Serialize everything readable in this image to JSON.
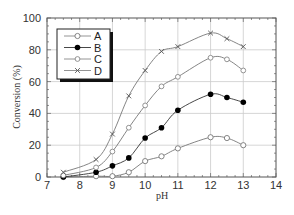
{
  "chart_data": {
    "type": "line",
    "title": "",
    "xlabel": "pH",
    "ylabel": "Conversion (%)",
    "xlim": [
      7,
      14
    ],
    "ylim": [
      0,
      100
    ],
    "xticks": [
      7,
      8,
      9,
      10,
      11,
      12,
      13,
      14
    ],
    "yticks": [
      0,
      20,
      40,
      60,
      80,
      100
    ],
    "grid": true,
    "legend_position": "upper left",
    "x": [
      7.5,
      8.5,
      9,
      9.5,
      10,
      10.5,
      11,
      12,
      12.5,
      13
    ],
    "series": [
      {
        "name": "A",
        "marker": "open-circle",
        "values": [
          0,
          0.5,
          0.5,
          3,
          10,
          13,
          18,
          25,
          24.5,
          20
        ]
      },
      {
        "name": "B",
        "marker": "filled-circle",
        "values": [
          0,
          3,
          7,
          12,
          24.5,
          31,
          42,
          52,
          50,
          47
        ]
      },
      {
        "name": "C",
        "marker": "open-diamond",
        "values": [
          1,
          6,
          16,
          31,
          45,
          57,
          63,
          75,
          74,
          67
        ]
      },
      {
        "name": "D",
        "marker": "cross",
        "values": [
          3,
          11,
          27,
          51,
          67,
          79,
          82,
          90.5,
          87,
          82
        ]
      }
    ]
  },
  "legend": {
    "items": [
      {
        "label": "A"
      },
      {
        "label": "B"
      },
      {
        "label": "C"
      },
      {
        "label": "D"
      }
    ]
  }
}
